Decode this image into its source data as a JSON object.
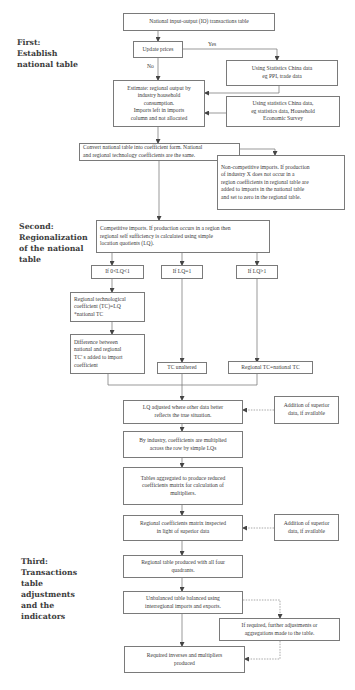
{
  "stages": [
    {
      "id": "first",
      "label": "First:\nEstablish\nnational table"
    },
    {
      "id": "second",
      "label": "Second:\nRegionalization\nof the national\ntable"
    },
    {
      "id": "third",
      "label": "Third:\nTransactions\ntable\nadjustments\nand the\nindicators"
    }
  ],
  "nodes": {
    "national_io": "National input-output (IO) transactions table",
    "update_prices": "Update prices",
    "stats_ppi": "Using Statistics China data\neg PPI, trade data",
    "estimate": "Estimate: regional output by\nindustry household\nconsumption.\nImports left in imports\ncolumn and not allocated",
    "stats_household": "Using statistics China data,\neg statistics data, Household\nEconomic Survey",
    "convert": "Convert national table into coefficient form. National\nand regional technology coefficients are the same.",
    "non_competitive": "Non-competitive imports. If production\nof industry X does not occur in a\nregion coefficients in regional table are\nadded to imports in  the national table\nand set to zero in the regional table.",
    "competitive": "Competitive imports. If production occurs in a region then\nregional self sufficiency is calculated using simple\nlocation quotients (LQ).",
    "lq_lt1": "If 0<LQ<1",
    "lq_eq1": "If LQ=1",
    "lq_gt1": "If LQ>1",
    "regional_tc": "Regional technological\ncoefficient (TC)=LQ\n*national TC",
    "difference": "Difference between\nnational and regional\nTC' s added to import\ncoefficient",
    "tc_unaltered": "TC unaltered",
    "regional_eq_national": "Regional TC=national TC",
    "lq_adjusted": "LQ adjusted where other data better\nreflects the true situation.",
    "superior_1": "Addition of superior\ndata, if available",
    "by_industry": "By industry, coefficients are multiplied\nacross the row by simple LQs",
    "tables_aggregated": "Tables aggregated to produce reduced\ncoefficients matrix for calculation of\nmultipliers.",
    "coeff_inspected": "Regional coefficients matrix inspected\nin light of superior data",
    "superior_2": "Addition of superior\ndata, if available",
    "regional_table": "Regional table produced with all four\nquadrants.",
    "unbalanced": "Unbalanced table balanced using\ninterregional imports and exports.",
    "further_adjust": "If required, further adjustments or\naggregations made to the table.",
    "inverses": "Required inverses and multipliers\nproduced"
  },
  "edge_labels": {
    "yes": "Yes",
    "no": "No"
  },
  "colors": {
    "line": "#6e6e6e",
    "border": "#7a7a7a",
    "text": "#3a3a3a"
  }
}
